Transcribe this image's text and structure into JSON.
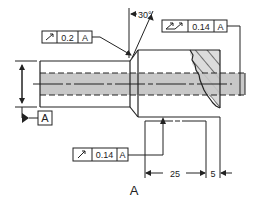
{
  "drawing": {
    "title_label": "A",
    "colors": {
      "line": "#222222",
      "shade": "#c8c8c8",
      "hatch_fill": "#dcdcdc",
      "background": "#ffffff"
    },
    "datum": {
      "label": "A"
    },
    "chamfer_angle": {
      "text": "30°"
    },
    "fcf_top_left": {
      "symbol": "circular-runout",
      "tolerance": "0.2",
      "datum": "A"
    },
    "fcf_top_right": {
      "symbol": "total-runout",
      "tolerance": "0.14",
      "datum": "A"
    },
    "fcf_bottom": {
      "symbol": "circular-runout",
      "tolerance": "0.14",
      "datum": "A"
    },
    "dimensions": {
      "length_1": "25",
      "length_2": "5"
    }
  }
}
